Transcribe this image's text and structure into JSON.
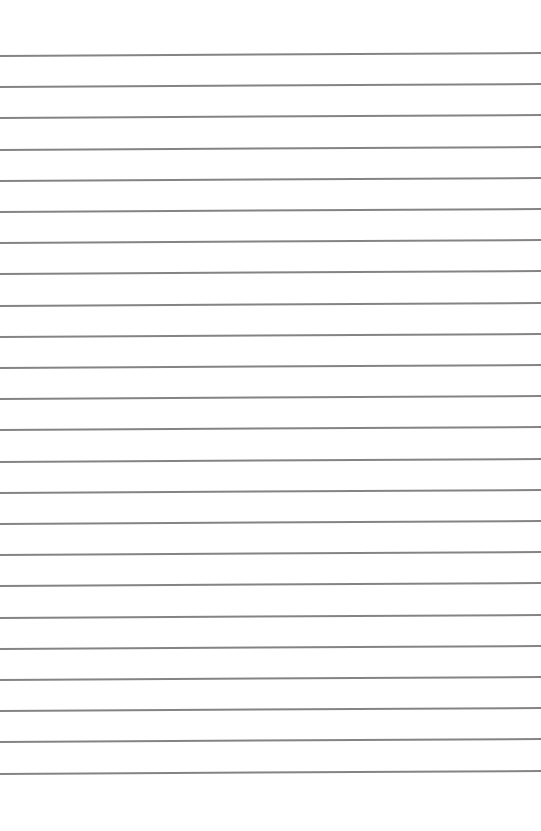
{
  "page": {
    "type": "ruled-paper",
    "background_color": "#ffffff",
    "line_color": "#6e6e6e",
    "line_count": 24,
    "first_line_y": 55,
    "line_spacing": 31.2,
    "line_tilt_px": -3
  }
}
